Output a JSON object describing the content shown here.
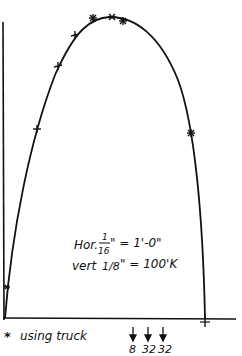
{
  "diagram": {
    "type": "moment-envelope-sketch",
    "curve": "parabola",
    "scale_note": {
      "horizontal_label": "Hor.",
      "horizontal_num": "1",
      "horizontal_den": "16",
      "horizontal_value": "\" = 1'-0\"",
      "vertical_label": "vert",
      "vertical_frac": "1/8",
      "vertical_value": "\" = 100'K"
    },
    "legend": {
      "marker": "*",
      "text": "using truck",
      "axle_loads": [
        "8",
        "32",
        "32"
      ]
    },
    "markers": [
      {
        "symbol": "*",
        "x": 7,
        "y": 287
      },
      {
        "symbol": "+",
        "x": 37,
        "y": 129
      },
      {
        "symbol": "+",
        "x": 58,
        "y": 66
      },
      {
        "symbol": "+",
        "x": 75,
        "y": 35
      },
      {
        "symbol": "*",
        "x": 93,
        "y": 18
      },
      {
        "symbol": "*",
        "x": 112,
        "y": 17
      },
      {
        "symbol": "*",
        "x": 123,
        "y": 21
      },
      {
        "symbol": "*",
        "x": 191,
        "y": 133
      }
    ],
    "colors": {
      "ink": "#111111",
      "paper": "#ffffff"
    }
  }
}
